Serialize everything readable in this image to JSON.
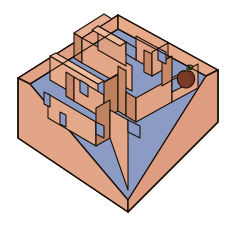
{
  "illustration": {
    "title": "Isometric maze box with apple",
    "type": "3d-isometric-maze",
    "background_color": "#ffffff",
    "canvas": {
      "width": 236,
      "height": 230
    }
  },
  "palette": {
    "outline": "#1a1008",
    "outer_wall_light": "#E8AE8F",
    "outer_wall_mid": "#E0A183",
    "outer_wall_shadow": "#D29274",
    "wall_top_rim": "#E3A488",
    "inner_wall_light": "#E5AC8D",
    "inner_wall_dark": "#C98B6B",
    "inner_wall_darker": "#BE8160",
    "floor_blue": "#8B9BC4",
    "floor_blue_dark": "#7E8DB8",
    "apple_body": "#7A3B2A",
    "apple_shade": "#5E2B1E",
    "apple_stem": "#4C6B2F",
    "apple_leaf": "#5C7F33"
  },
  "geometry": {
    "corner_left": [
      18,
      78
    ],
    "corner_top": [
      118,
      15
    ],
    "corner_right": [
      218,
      70
    ],
    "corner_bottom": [
      128,
      212
    ],
    "wall_height": 52
  },
  "objects": {
    "apple": {
      "name": "apple",
      "position": [
        186,
        79
      ],
      "radius": 9
    }
  },
  "labels": {
    "maze": "maze",
    "apple": "apple",
    "floor": "floor",
    "outer_walls": "outer walls",
    "inner_walls": "inner walls"
  }
}
